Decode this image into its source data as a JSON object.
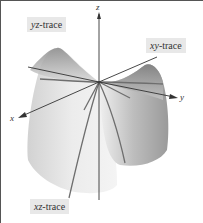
{
  "figure": {
    "type": "3d-surface-diagram",
    "surface": "hyperbolic paraboloid (saddle)",
    "labels": {
      "yz_trace": {
        "var": "yz",
        "suffix": "-trace"
      },
      "xy_trace": {
        "var": "xy",
        "suffix": "-trace"
      },
      "xz_trace": {
        "var": "xz",
        "suffix": "-trace"
      }
    },
    "axes": {
      "x": "x",
      "y": "y",
      "z": "z"
    },
    "colors": {
      "surface_light": "#e6e6e6",
      "surface_mid": "#c8c8c8",
      "surface_dark": "#8c8c8c",
      "trace_line": "#6e6e6e",
      "axis": "#333333",
      "label_bg": "#e8e8e8",
      "border": "#555555"
    }
  }
}
